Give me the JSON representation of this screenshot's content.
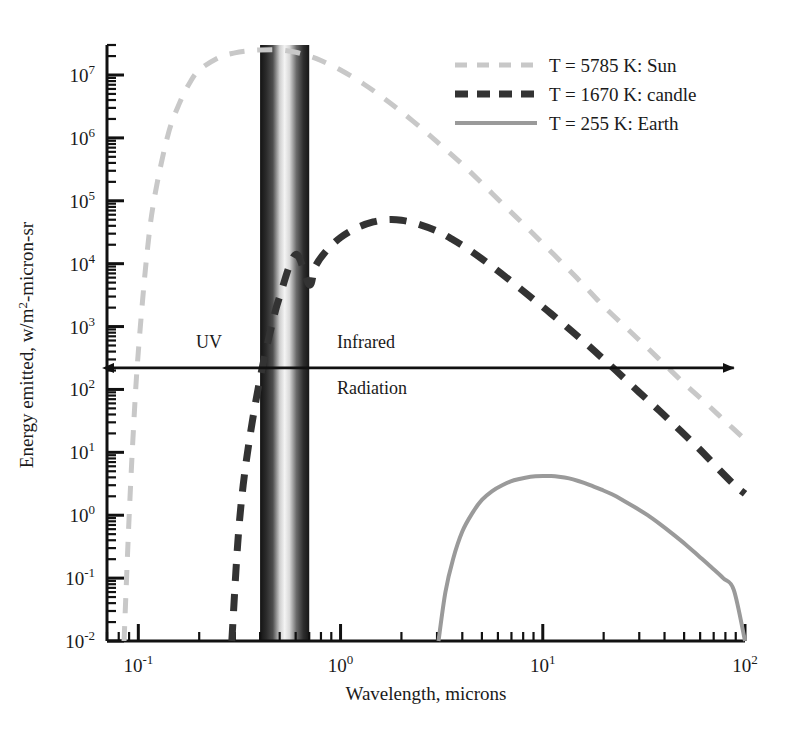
{
  "chart_data": {
    "type": "line",
    "title": "",
    "xlabel": "Wavelength, microns",
    "ylabel": "Energy emitted, w/m²-micron-sr",
    "xscale": "log",
    "yscale": "log",
    "xlim": [
      0.07,
      100
    ],
    "ylim": [
      0.01,
      30000000
    ],
    "grid": false,
    "legend_position": "top-right",
    "xticks": [
      {
        "value": 0.1,
        "label": "10⁻¹",
        "mantissa": "10",
        "exponent": "-1"
      },
      {
        "value": 1,
        "label": "10⁰",
        "mantissa": "10",
        "exponent": "0"
      },
      {
        "value": 10,
        "label": "10¹",
        "mantissa": "10",
        "exponent": "1"
      },
      {
        "value": 100,
        "label": "10²",
        "mantissa": "10",
        "exponent": "2"
      }
    ],
    "yticks": [
      {
        "value": 0.01,
        "mantissa": "10",
        "exponent": "-2"
      },
      {
        "value": 0.1,
        "mantissa": "10",
        "exponent": "-1"
      },
      {
        "value": 1,
        "mantissa": "10",
        "exponent": "0"
      },
      {
        "value": 10,
        "mantissa": "10",
        "exponent": "1"
      },
      {
        "value": 100,
        "mantissa": "10",
        "exponent": "2"
      },
      {
        "value": 1000,
        "mantissa": "10",
        "exponent": "3"
      },
      {
        "value": 10000,
        "mantissa": "10",
        "exponent": "4"
      },
      {
        "value": 100000,
        "mantissa": "10",
        "exponent": "5"
      },
      {
        "value": 1000000,
        "mantissa": "10",
        "exponent": "6"
      },
      {
        "value": 10000000,
        "mantissa": "10",
        "exponent": "7"
      }
    ],
    "series": [
      {
        "name": "T = 5785 K: Sun",
        "temperature_k": 5785,
        "body": "Sun",
        "style": "dashed",
        "color": "#c8c8c8",
        "width": 5,
        "peak_wavelength_um": 0.5,
        "peak_value": 25000000,
        "points": [
          [
            0.085,
            0.01
          ],
          [
            0.09,
            0.9
          ],
          [
            0.095,
            30
          ],
          [
            0.1,
            400
          ],
          [
            0.11,
            13000
          ],
          [
            0.12,
            110000
          ],
          [
            0.14,
            1100000
          ],
          [
            0.16,
            3600000
          ],
          [
            0.18,
            7600000
          ],
          [
            0.2,
            12000000
          ],
          [
            0.25,
            19000000
          ],
          [
            0.3,
            22500000
          ],
          [
            0.35,
            24200000
          ],
          [
            0.4,
            25000000
          ],
          [
            0.5,
            25000000
          ],
          [
            0.6,
            23000000
          ],
          [
            0.7,
            20000000
          ],
          [
            0.8,
            17000000
          ],
          [
            1.0,
            12000000
          ],
          [
            1.3,
            7200000
          ],
          [
            1.6,
            4500000
          ],
          [
            2.0,
            2600000
          ],
          [
            2.6,
            1300000
          ],
          [
            3.2,
            720000
          ],
          [
            4.0,
            380000
          ],
          [
            5.0,
            190000
          ],
          [
            6.5,
            82000
          ],
          [
            8.0,
            43000
          ],
          [
            10.0,
            21000
          ],
          [
            13.0,
            9000
          ],
          [
            16.0,
            4500
          ],
          [
            20.0,
            2100
          ],
          [
            26.0,
            940
          ],
          [
            32.0,
            500
          ],
          [
            40.0,
            250
          ],
          [
            50.0,
            125
          ],
          [
            65.0,
            58
          ],
          [
            80.0,
            31
          ],
          [
            100.0,
            16
          ]
        ]
      },
      {
        "name": "T = 1670 K: candle",
        "temperature_k": 1670,
        "body": "candle",
        "style": "dashed",
        "color": "#333333",
        "width": 7,
        "peak_wavelength_um": 1.7,
        "peak_value": 50000,
        "points": [
          [
            0.29,
            0.01
          ],
          [
            0.31,
            0.35
          ],
          [
            0.33,
            3.0
          ],
          [
            0.36,
            22
          ],
          [
            0.4,
            150
          ],
          [
            0.45,
            850
          ],
          [
            0.5,
            3000
          ],
          [
            0.6,
            14000
          ],
          [
            0.7,
            4600
          ],
          [
            0.75,
            9000
          ],
          [
            0.85,
            16000
          ],
          [
            1.0,
            26000
          ],
          [
            1.2,
            37000
          ],
          [
            1.45,
            46000
          ],
          [
            1.7,
            50000
          ],
          [
            2.0,
            49000
          ],
          [
            2.4,
            43000
          ],
          [
            3.0,
            33000
          ],
          [
            3.6,
            24000
          ],
          [
            4.4,
            16000
          ],
          [
            5.5,
            9500
          ],
          [
            7.0,
            5200
          ],
          [
            9.0,
            2700
          ],
          [
            11.0,
            1600
          ],
          [
            14.0,
            830
          ],
          [
            18.0,
            410
          ],
          [
            23.0,
            200
          ],
          [
            30.0,
            90
          ],
          [
            38.0,
            45
          ],
          [
            48.0,
            22
          ],
          [
            60.0,
            11
          ],
          [
            75.0,
            5.2
          ],
          [
            90.0,
            2.9
          ],
          [
            100.0,
            2.2
          ]
        ]
      },
      {
        "name": "T = 255 K: Earth",
        "temperature_k": 255,
        "body": "Earth",
        "style": "solid",
        "color": "#9a9a9a",
        "width": 4,
        "peak_wavelength_um": 11.0,
        "peak_value": 4.2,
        "points": [
          [
            3.05,
            0.01
          ],
          [
            3.3,
            0.06
          ],
          [
            3.6,
            0.2
          ],
          [
            4.0,
            0.55
          ],
          [
            4.5,
            1.1
          ],
          [
            5.0,
            1.75
          ],
          [
            5.6,
            2.4
          ],
          [
            6.3,
            3.0
          ],
          [
            7.2,
            3.6
          ],
          [
            8.2,
            3.95
          ],
          [
            9.2,
            4.15
          ],
          [
            10.2,
            4.2
          ],
          [
            11.0,
            4.2
          ],
          [
            12.0,
            4.1
          ],
          [
            13.5,
            3.85
          ],
          [
            15.0,
            3.5
          ],
          [
            17.0,
            3.05
          ],
          [
            19.5,
            2.55
          ],
          [
            22.0,
            2.15
          ],
          [
            25.0,
            1.72
          ],
          [
            29.0,
            1.3
          ],
          [
            33.0,
            1.0
          ],
          [
            38.0,
            0.72
          ],
          [
            44.0,
            0.5
          ],
          [
            51.0,
            0.34
          ],
          [
            59.0,
            0.225
          ],
          [
            68.0,
            0.15
          ],
          [
            78.0,
            0.1
          ],
          [
            88.0,
            0.065
          ],
          [
            100.0,
            0.01
          ]
        ]
      }
    ],
    "annotations": {
      "arrow": {
        "label_left": "UV",
        "label_right_top": "Infrared",
        "label_right_bottom": "Radiation",
        "y_value": 220,
        "x_start": 0.075,
        "x_end": 88
      },
      "visible_band": {
        "name": "visible-spectrum-band",
        "x_start_um": 0.4,
        "x_end_um": 0.7,
        "gradient": [
          "#141414",
          "#3a3a3a",
          "#f2f2f2",
          "#5a5a5a",
          "#1a1a1a"
        ]
      }
    }
  },
  "legend": {
    "entries": [
      {
        "label": "T = 5785 K: Sun"
      },
      {
        "label": "T = 1670 K: candle"
      },
      {
        "label": "T = 255 K: Earth"
      }
    ]
  },
  "colors": {
    "axis": "#111111",
    "sun": "#c8c8c8",
    "candle": "#333333",
    "earth": "#9a9a9a",
    "background": "#ffffff"
  }
}
